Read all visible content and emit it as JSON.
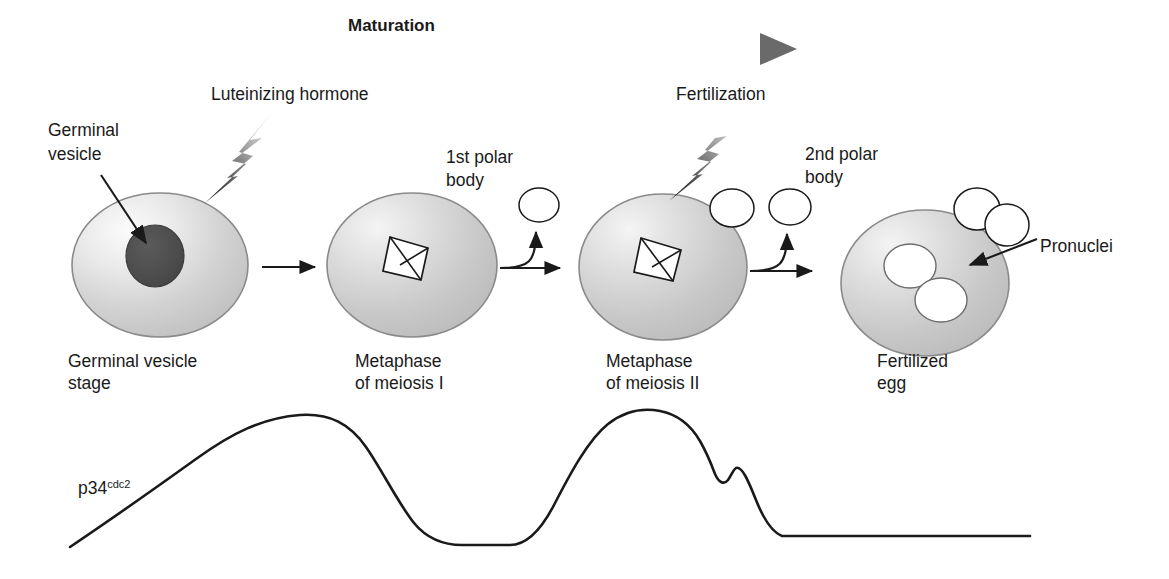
{
  "figure": {
    "title": "Maturation",
    "process_arrow": "maturation-arrow"
  },
  "stimuli": [
    {
      "id": "luteinizing-hormone",
      "label": "Luteinizing hormone"
    },
    {
      "id": "fertilization",
      "label": "Fertilization"
    }
  ],
  "stages": [
    {
      "id": "germinal-vesicle-stage",
      "caption_line1": "Germinal vesicle",
      "caption_line2": "stage",
      "callout_line1": "Germinal",
      "callout_line2": "vesicle"
    },
    {
      "id": "metaphase-meiosis-i",
      "caption_line1": "Metaphase",
      "caption_line2": "of meiosis I"
    },
    {
      "id": "metaphase-meiosis-ii",
      "caption_line1": "Metaphase",
      "caption_line2": "of meiosis II"
    },
    {
      "id": "fertilized-egg",
      "caption_line1": "Fertilized",
      "caption_line2": "egg",
      "callout": "Pronuclei"
    }
  ],
  "polar_bodies": [
    {
      "id": "first-polar-body",
      "label_line1": "1st polar",
      "label_line2": "body"
    },
    {
      "id": "second-polar-body",
      "label_line1": "2nd polar",
      "label_line2": "body"
    }
  ],
  "curve": {
    "label_base": "p34",
    "label_superscript": "cdc2",
    "description": "p34cdc2 kinase activity through oocyte maturation and fertilization"
  },
  "colors": {
    "arrow_gray": "#6e6e6e",
    "cell_fill_light": "#f2f2f2",
    "cell_fill_mid": "#c9c9c9",
    "cell_stroke": "#808080",
    "nucleus_fill": "#4a4a4a",
    "ink": "#1a1a1a",
    "bolt_light": "#e6e6e6",
    "bolt_dark": "#2b2b2b"
  }
}
